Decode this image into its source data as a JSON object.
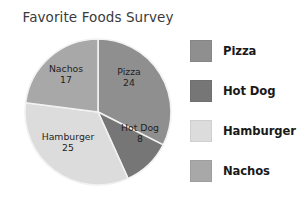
{
  "chart_data": {
    "type": "pie",
    "title": "Favorite Foods Survey",
    "xlabel": "",
    "ylabel": "",
    "legend_position": "right",
    "grid": false,
    "total": 74,
    "start_angle_deg": 0,
    "direction": "clockwise",
    "categories": [
      "Pizza",
      "Hot Dog",
      "Hamburger",
      "Nachos"
    ],
    "values": [
      24,
      8,
      25,
      17
    ],
    "slices": [
      {
        "label": "Pizza",
        "value": 24,
        "value_text": "24",
        "percent": 32.4,
        "angle_deg": 116.76,
        "color": "#8f8f8f",
        "label_x": 129,
        "label_y": 77
      },
      {
        "label": "Hot Dog",
        "value": 8,
        "value_text": "8",
        "percent": 10.8,
        "angle_deg": 38.92,
        "color": "#767676",
        "label_x": 140,
        "label_y": 133
      },
      {
        "label": "Hamburger",
        "value": 25,
        "value_text": "25",
        "percent": 33.8,
        "angle_deg": 121.62,
        "color": "#dcdcdc",
        "label_x": 68,
        "label_y": 142
      },
      {
        "label": "Nachos",
        "value": 17,
        "value_text": "17",
        "percent": 23.0,
        "angle_deg": 82.7,
        "color": "#a8a8a8",
        "label_x": 66,
        "label_y": 74
      }
    ],
    "legend": [
      {
        "label": "Pizza",
        "color": "#8f8f8f"
      },
      {
        "label": "Hot Dog",
        "color": "#767676"
      },
      {
        "label": "Hamburger",
        "color": "#dcdcdc"
      },
      {
        "label": "Nachos",
        "color": "#a8a8a8"
      }
    ],
    "geometry": {
      "center_x": 98,
      "center_y": 112,
      "radius": 73,
      "divider_color": "#f2f2f2",
      "divider_width": 1.6
    },
    "background": "#ffffff"
  }
}
